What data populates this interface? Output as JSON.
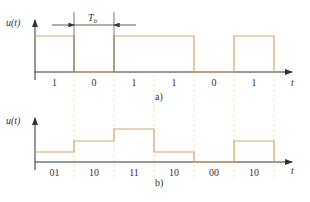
{
  "colors": {
    "signal": "#d9a46a",
    "axis": "#333333",
    "guide": "#f3e6b3",
    "text": "#333333"
  },
  "geometry": {
    "boundaries_x": [
      35,
      74,
      114,
      154,
      194,
      234,
      274
    ]
  },
  "figure_a": {
    "y_label": "u(t)",
    "x_label": "t",
    "caption": "a)",
    "period_label": "T",
    "period_subscript": "b",
    "bits": [
      "1",
      "0",
      "1",
      "1",
      "0",
      "1"
    ],
    "levels_y": [
      36,
      72,
      36,
      36,
      72,
      36
    ],
    "baseline_y": 72
  },
  "figure_b": {
    "y_label": "u(t)",
    "x_label": "t",
    "caption": "b)",
    "symbols": [
      "01",
      "10",
      "11",
      "10",
      "00",
      "10"
    ],
    "levels_y": [
      152,
      141,
      129,
      152,
      162,
      141
    ],
    "baseline_y": 162
  }
}
